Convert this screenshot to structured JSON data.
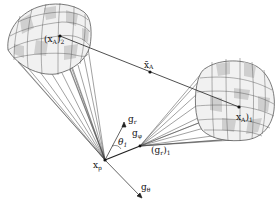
{
  "diagram": {
    "title": "",
    "labels": {
      "xA2": "(x",
      "xA2_sub": "A",
      "xA2_close": ")",
      "xA2_outer_sub": "2",
      "xA1": "x",
      "xA1_sub": "A",
      "xA1_close": ")",
      "xA1_outer_sub": "1",
      "xAbar": "x̄",
      "xAbar_sub": "A",
      "xp": "x",
      "xp_sub": "p",
      "gr": "g",
      "gr_sub": "r",
      "gphi": "g",
      "gphi_sub": "φ",
      "gtheta": "g",
      "gtheta_sub": "θ",
      "theta1": "θ",
      "theta1_sub": "1",
      "gr1": "(g",
      "gr1_sub": "r",
      "gr1_close": ")",
      "gr1_outer_sub": "1"
    },
    "colors": {
      "line": "#222222",
      "mesh": "#555555",
      "fill_light": "#f2f2f2",
      "fill_dark": "#cfcfcf"
    }
  }
}
